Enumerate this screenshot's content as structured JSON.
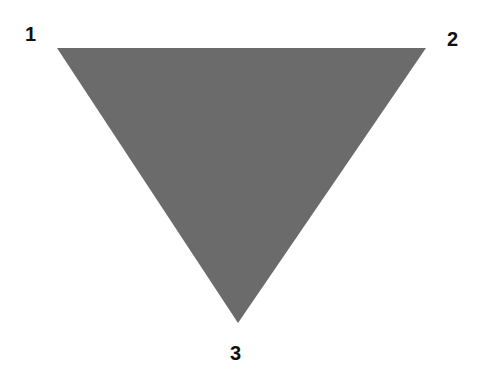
{
  "diagram": {
    "shape": "inverted-triangle",
    "fill_color": "#6b6b6b",
    "vertices": [
      {
        "label": "1",
        "x": 57,
        "y": 48
      },
      {
        "label": "2",
        "x": 426,
        "y": 48
      },
      {
        "label": "3",
        "x": 238,
        "y": 323
      }
    ]
  }
}
